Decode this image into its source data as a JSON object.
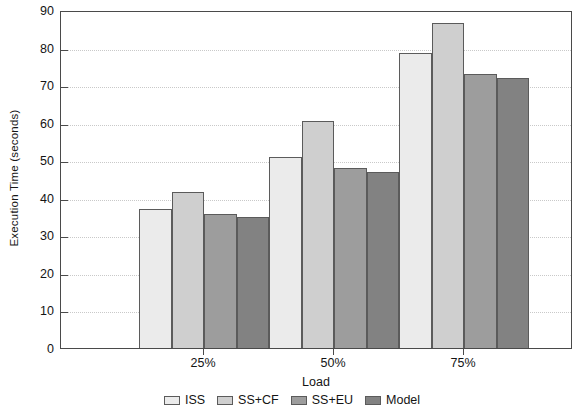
{
  "chart_data": {
    "type": "bar",
    "title": "",
    "subtitle": "",
    "xlabel": "Load",
    "ylabel": "Execution Time (seconds)",
    "categories": [
      "25%",
      "50%",
      "75%"
    ],
    "series": [
      {
        "name": "ISS",
        "values": [
          37.5,
          51.5,
          79.0
        ],
        "color": "#ebebeb"
      },
      {
        "name": "SS+CF",
        "values": [
          42.0,
          61.0,
          87.0
        ],
        "color": "#cfcfcf"
      },
      {
        "name": "SS+EU",
        "values": [
          36.3,
          48.5,
          73.5
        ],
        "color": "#9d9d9d"
      },
      {
        "name": "Model",
        "values": [
          35.3,
          47.5,
          72.5
        ],
        "color": "#828282"
      }
    ],
    "ylim": [
      0,
      90
    ],
    "ytick_values": [
      0,
      10,
      20,
      30,
      40,
      50,
      60,
      70,
      80,
      90
    ],
    "ytick_labels": [
      "0",
      "10",
      "20",
      "30",
      "40",
      "50",
      "60",
      "70",
      "80",
      "90"
    ],
    "xtick_labels": [
      "25%",
      "50%",
      "75%"
    ],
    "grid": "horizontal-dotted",
    "legend_position": "bottom-center",
    "axis_color": "#4a4a4a",
    "grid_color": "#c9c9c9",
    "text_color": "#141414",
    "background": "#ffffff"
  }
}
